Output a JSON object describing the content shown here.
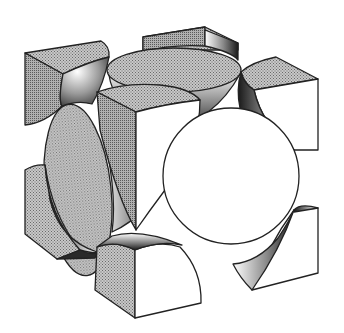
{
  "diagram": {
    "type": "fcc-unit-cell",
    "colors": {
      "background": "#ffffff",
      "outline": "#222222",
      "stipple_face": "#b4b4b4",
      "stipple_face_dark": "#a0a0a0",
      "white_face": "#ffffff",
      "shadow_dark": "#1a1a1a",
      "shadow_mid": "#7a7a7a"
    },
    "parts": {
      "corner_atoms": [
        {
          "id": "top-left-back"
        },
        {
          "id": "top-back"
        },
        {
          "id": "top-right"
        },
        {
          "id": "top-front"
        },
        {
          "id": "bottom-left"
        },
        {
          "id": "bottom-front"
        },
        {
          "id": "bottom-right"
        }
      ],
      "face_atoms": [
        {
          "id": "top-face",
          "shape": "ellipse"
        },
        {
          "id": "left-face",
          "shape": "ellipse"
        },
        {
          "id": "front-right-face",
          "shape": "circle"
        }
      ]
    }
  }
}
